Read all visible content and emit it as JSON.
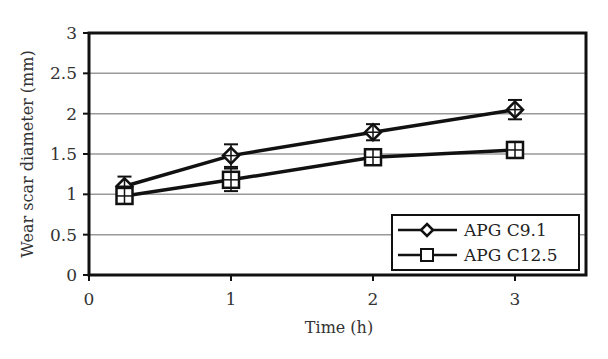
{
  "chart_data": {
    "type": "line",
    "title": "",
    "xlabel": "Time (h)",
    "ylabel": "Wear scar diameter (mm)",
    "xlim": [
      0,
      3.5
    ],
    "ylim": [
      0,
      3
    ],
    "xticks": [
      0,
      1,
      2,
      3
    ],
    "yticks": [
      0,
      0.5,
      1,
      1.5,
      2,
      2.5,
      3
    ],
    "xtick_labels": [
      "0",
      "1",
      "2",
      "3"
    ],
    "ytick_labels": [
      "0",
      "0.5",
      "1",
      "1.5",
      "2",
      "2.5",
      "3"
    ],
    "grid": "horizontal",
    "legend_position": "lower right",
    "x": [
      0.25,
      1,
      2,
      3
    ],
    "series": [
      {
        "name": "APG C9.1",
        "marker": "diamond",
        "values": [
          1.1,
          1.48,
          1.77,
          2.05
        ],
        "errors": [
          0.12,
          0.14,
          0.1,
          0.12
        ]
      },
      {
        "name": "APG C12.5",
        "marker": "square",
        "values": [
          0.98,
          1.18,
          1.46,
          1.55
        ],
        "errors": [
          0.08,
          0.14,
          0.07,
          0.1
        ]
      }
    ]
  }
}
